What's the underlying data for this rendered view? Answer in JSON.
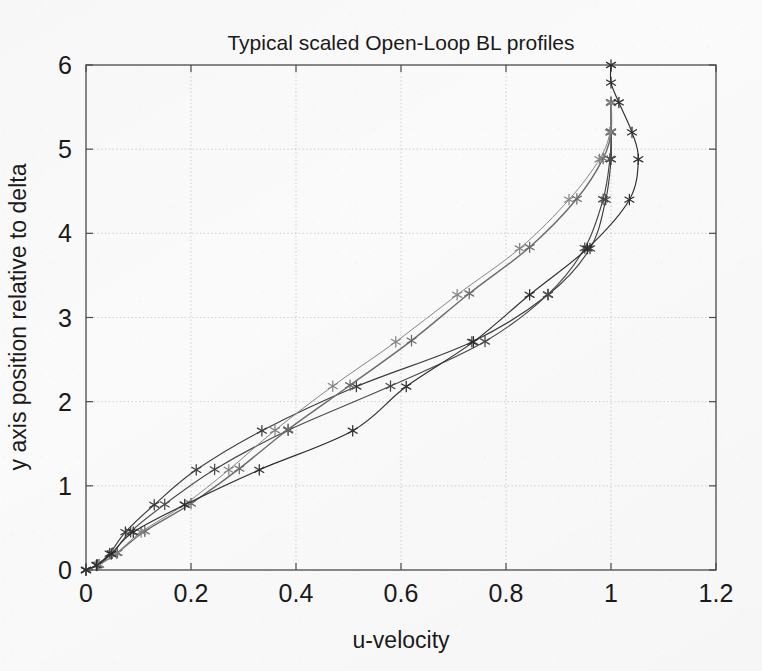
{
  "chart_data": {
    "type": "line",
    "title": "Typical scaled Open-Loop BL profiles",
    "xlabel": "u-velocity",
    "ylabel": "y axis position relative to delta",
    "xlim": [
      0,
      1.2
    ],
    "ylim": [
      0,
      6
    ],
    "xticks": [
      "0",
      "0.2",
      "0.4",
      "0.6",
      "0.8",
      "1",
      "1.2"
    ],
    "xtick_values": [
      0,
      0.2,
      0.4,
      0.6,
      0.8,
      1.0,
      1.2
    ],
    "yticks": [
      "0",
      "1",
      "2",
      "3",
      "4",
      "5",
      "6"
    ],
    "ytick_values": [
      0,
      1,
      2,
      3,
      4,
      5,
      6
    ],
    "grid": true,
    "grid_style": "dotted",
    "legend": "none",
    "marker": "asterisk",
    "series": [
      {
        "name": "profile-1",
        "color": "#3c3c3c",
        "width": 1.15,
        "x": [
          0.0,
          0.02,
          0.045,
          0.075,
          0.13,
          0.21,
          0.335,
          0.515,
          0.735,
          0.88,
          0.96,
          0.99,
          1.0,
          1.0,
          1.0
        ],
        "y": [
          0.0,
          0.06,
          0.195,
          0.45,
          0.775,
          1.19,
          1.655,
          2.18,
          2.71,
          3.27,
          3.82,
          4.4,
          4.88,
          5.2,
          5.55
        ]
      },
      {
        "name": "profile-2",
        "color": "#4a4a4a",
        "width": 1.15,
        "x": [
          0.0,
          0.022,
          0.05,
          0.085,
          0.15,
          0.245,
          0.385,
          0.58,
          0.76,
          0.88,
          0.95,
          0.985,
          0.998,
          1.0,
          1.0
        ],
        "y": [
          0.0,
          0.06,
          0.2,
          0.455,
          0.78,
          1.195,
          1.66,
          2.185,
          2.715,
          3.275,
          3.825,
          4.405,
          4.885,
          5.205,
          5.555
        ]
      },
      {
        "name": "profile-3",
        "color": "#6b6b6b",
        "width": 1.4,
        "x": [
          0.0,
          0.025,
          0.06,
          0.112,
          0.2,
          0.292,
          0.385,
          0.503,
          0.62,
          0.73,
          0.845,
          0.935,
          0.985,
          1.0,
          1.0
        ],
        "y": [
          0.0,
          0.065,
          0.205,
          0.46,
          0.79,
          1.205,
          1.67,
          2.195,
          2.725,
          3.285,
          3.835,
          4.41,
          4.89,
          5.21,
          5.56
        ]
      },
      {
        "name": "profile-4",
        "color": "#858585",
        "width": 1.0,
        "x": [
          0.0,
          0.024,
          0.058,
          0.105,
          0.188,
          0.272,
          0.36,
          0.47,
          0.59,
          0.707,
          0.826,
          0.92,
          0.978,
          0.998,
          1.0
        ],
        "y": [
          0.0,
          0.062,
          0.2,
          0.452,
          0.78,
          1.19,
          1.66,
          2.185,
          2.71,
          3.27,
          3.82,
          4.4,
          4.88,
          5.2,
          5.55
        ]
      },
      {
        "name": "profile-5-overshoot",
        "color": "#2e2e2e",
        "width": 1.15,
        "x": [
          0.0,
          0.02,
          0.048,
          0.09,
          0.188,
          0.33,
          0.508,
          0.61,
          0.738,
          0.845,
          0.955,
          1.035,
          1.052,
          1.04,
          1.015,
          1.0,
          1.0
        ],
        "y": [
          0.0,
          0.055,
          0.19,
          0.45,
          0.775,
          1.19,
          1.655,
          2.18,
          2.71,
          3.27,
          3.82,
          4.4,
          4.88,
          5.2,
          5.555,
          5.79,
          6.0
        ]
      }
    ]
  }
}
